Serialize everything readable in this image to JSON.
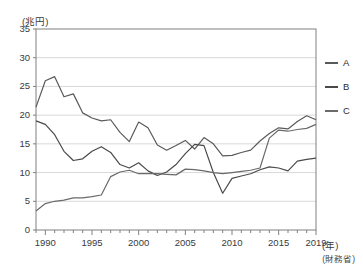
{
  "chart_data": {
    "type": "line",
    "title": "",
    "unit_label": "(兆円)",
    "xlabel": "(年)",
    "ylabel": "",
    "source": "(財務省)",
    "xlim": [
      1989,
      2019
    ],
    "ylim": [
      0,
      35
    ],
    "ytick_values": [
      0,
      5,
      10,
      15,
      20,
      25,
      30,
      35
    ],
    "ytick_labels": [
      "0",
      "5",
      "10",
      "15",
      "20",
      "25",
      "30",
      "35"
    ],
    "xtick_values": [
      1990,
      1995,
      2000,
      2005,
      2010,
      2015,
      2019
    ],
    "xtick_labels": [
      "1990",
      "1995",
      "2000",
      "2005",
      "2010",
      "2015",
      "2019"
    ],
    "grid": "horizontal",
    "legend_position": "right",
    "x": [
      1989,
      1990,
      1991,
      1992,
      1993,
      1994,
      1995,
      1996,
      1997,
      1998,
      1999,
      2000,
      2001,
      2002,
      2003,
      2004,
      2005,
      2006,
      2007,
      2008,
      2009,
      2010,
      2011,
      2012,
      2013,
      2014,
      2015,
      2016,
      2017,
      2018,
      2019
    ],
    "series": [
      {
        "name": "A",
        "color": "#5a5a5a",
        "values": [
          21.4,
          26.0,
          26.7,
          23.2,
          23.7,
          20.4,
          19.5,
          19.0,
          19.2,
          17.0,
          15.4,
          18.8,
          17.8,
          14.8,
          13.9,
          14.7,
          15.6,
          14.1,
          16.1,
          15.0,
          12.9,
          13.0,
          13.5,
          13.9,
          15.5,
          16.8,
          17.8,
          17.6,
          18.9,
          19.9,
          19.2
        ]
      },
      {
        "name": "B",
        "color": "#4a4a4a",
        "values": [
          19.0,
          18.4,
          16.6,
          13.7,
          12.1,
          12.4,
          13.7,
          14.5,
          13.5,
          11.4,
          10.8,
          11.7,
          10.3,
          9.5,
          10.1,
          11.4,
          13.3,
          14.9,
          14.7,
          10.0,
          6.4,
          9.0,
          9.4,
          9.8,
          10.5,
          11.0,
          10.8,
          10.3,
          12.0,
          12.3,
          12.5
        ]
      },
      {
        "name": "C",
        "color": "#6a6a6a",
        "values": [
          3.3,
          4.6,
          5.0,
          5.2,
          5.6,
          5.6,
          5.8,
          6.1,
          9.3,
          10.1,
          10.4,
          9.8,
          9.8,
          9.8,
          9.7,
          9.6,
          10.6,
          10.5,
          10.3,
          10.0,
          9.8,
          10.0,
          10.2,
          10.4,
          10.8,
          16.0,
          17.4,
          17.2,
          17.5,
          17.7,
          18.4
        ]
      }
    ]
  },
  "legend": {
    "items": [
      {
        "label": "A"
      },
      {
        "label": "B"
      },
      {
        "label": "C"
      }
    ]
  }
}
